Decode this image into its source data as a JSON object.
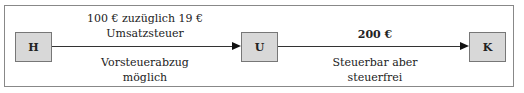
{
  "diagram": {
    "nodes": [
      {
        "id": "H",
        "label": "H"
      },
      {
        "id": "U",
        "label": "U"
      },
      {
        "id": "K",
        "label": "K"
      }
    ],
    "edges": [
      {
        "from": "H",
        "to": "U",
        "label_above": [
          "100 € zuzüglich 19 €",
          "Umsatzsteuer"
        ],
        "label_below": [
          "Vorsteuerabzug",
          "möglich"
        ]
      },
      {
        "from": "U",
        "to": "K",
        "label_above": [
          "200 €"
        ],
        "label_below": [
          "Steuerbar aber",
          "steuerfrei"
        ]
      }
    ],
    "colors": {
      "box_fill": "#d8d8d8",
      "frame": "#888888",
      "line": "#333333"
    }
  }
}
